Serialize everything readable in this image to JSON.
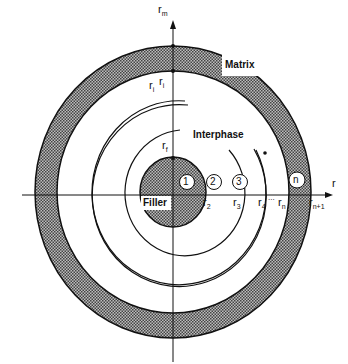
{
  "diagram": {
    "type": "concentric-ring model",
    "labels": {
      "matrix": "Matrix",
      "interphase": "Interphase",
      "filler": "Filler"
    },
    "axes": {
      "vertical_label": "r",
      "vertical_sub": "m",
      "horizontal_label": "r"
    },
    "radii_labels": [
      {
        "base": "r",
        "sub": "f"
      },
      {
        "base": "r",
        "sub": "i"
      },
      {
        "base": "r",
        "sub": "i"
      },
      {
        "base": "r",
        "sub": "2"
      },
      {
        "base": "r",
        "sub": "3"
      },
      {
        "base": "r",
        "sub": "4"
      },
      {
        "ellipsis": "..."
      },
      {
        "base": "r",
        "sub": "n"
      },
      {
        "base": "r",
        "sub": "n+1"
      }
    ],
    "layer_markers": [
      "1",
      "2",
      "3",
      "n"
    ],
    "dot": "•"
  }
}
